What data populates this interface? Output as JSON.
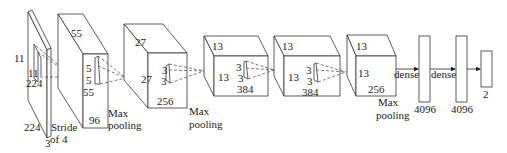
{
  "diagram": {
    "input": {
      "labels": {
        "height_side": "11",
        "kernel_w": "11",
        "kernel_h": "224",
        "width": "224",
        "depth": "3",
        "stride_line1": "Stride",
        "stride_line2": "of 4"
      }
    },
    "conv1": {
      "top": "55",
      "side": "55",
      "kernel_a": "5",
      "kernel_b": "5",
      "depth": "96",
      "pool_line1": "Max",
      "pool_line2": "pooling"
    },
    "conv2": {
      "top": "27",
      "side": "27",
      "kernel_a": "3",
      "kernel_b": "3",
      "depth": "256",
      "pool_line1": "Max",
      "pool_line2": "pooling"
    },
    "conv3": {
      "top": "13",
      "side": "13",
      "kernel_a": "3",
      "kernel_b": "3",
      "depth": "384"
    },
    "conv4": {
      "top": "13",
      "side": "13",
      "kernel_a": "3",
      "kernel_b": "3",
      "depth": "384"
    },
    "conv5": {
      "top": "13",
      "side": "13",
      "depth": "256",
      "pool_line1": "Max",
      "pool_line2": "pooling"
    },
    "dense": [
      {
        "arrow_label": "dense",
        "units": "4096"
      },
      {
        "arrow_label": "dense",
        "units": "4096"
      },
      {
        "arrow_label": "",
        "units": "2"
      }
    ]
  }
}
